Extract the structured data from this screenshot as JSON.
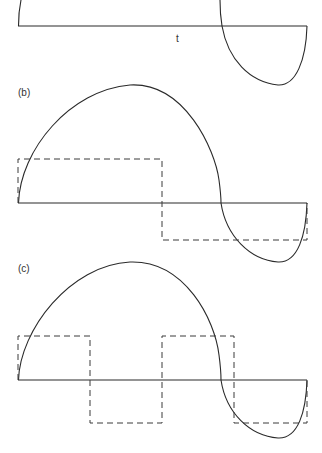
{
  "panels": [
    {
      "id": "a",
      "label": "",
      "axis_label": "t",
      "description": "Continuous waveform (solid) — tail of panel (a), partially cropped at top"
    },
    {
      "id": "b",
      "label": "(b)",
      "description": "Continuous waveform (solid) with single-period square wave approximation (dashed)"
    },
    {
      "id": "c",
      "label": "(c)",
      "description": "Continuous waveform (solid) with double-frequency square wave (dashed)"
    }
  ],
  "colors": {
    "stroke": "#2a2a2a",
    "background": "#ffffff"
  }
}
